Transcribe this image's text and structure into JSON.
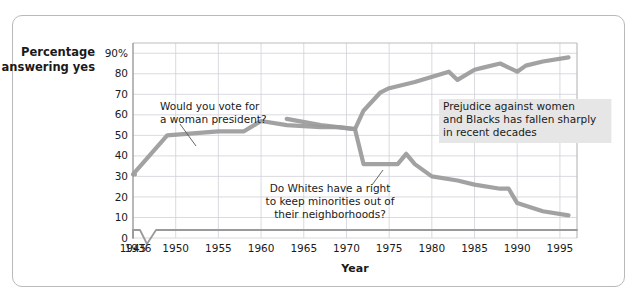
{
  "figure": {
    "border_color": "#b9b9b9",
    "background": "#ffffff"
  },
  "chart_data": {
    "type": "line",
    "title": "",
    "xlabel": "Year",
    "ylabel": "Percentage answering yes",
    "ylabel_line1": "Percentage",
    "ylabel_line2": "answering yes",
    "xlim": [
      1945,
      1997
    ],
    "ylim": [
      0,
      95
    ],
    "grid": true,
    "legend": "none",
    "axis_break": {
      "present": true,
      "between": [
        1936,
        1945
      ],
      "note": "zigzag break on x-axis baseline"
    },
    "series_color": "#9a9a9a",
    "xticks": [
      "1936",
      "1945",
      "1950",
      "1955",
      "1960",
      "1965",
      "1970",
      "1975",
      "1980",
      "1985",
      "1990",
      "1995"
    ],
    "yticks": [
      "0",
      "10",
      "20",
      "30",
      "40",
      "50",
      "60",
      "70",
      "80",
      "90%"
    ],
    "ytick_values": [
      0,
      10,
      20,
      30,
      40,
      50,
      60,
      70,
      80,
      90
    ],
    "series": [
      {
        "name": "Would you vote for a woman president?",
        "color": "#9a9a9a",
        "x": [
          1936,
          1945,
          1949,
          1955,
          1958,
          1960,
          1963,
          1967,
          1969,
          1971,
          1972,
          1974,
          1975,
          1978,
          1982,
          1983,
          1985,
          1986,
          1988,
          1990,
          1991,
          1993,
          1996
        ],
        "y": [
          31,
          31,
          50,
          52,
          52,
          57,
          55,
          54,
          54,
          53,
          62,
          71,
          73,
          76,
          81,
          77,
          82,
          83,
          85,
          81,
          84,
          86,
          88
        ]
      },
      {
        "name": "Do Whites have a right to keep minorities out of their neighborhoods?",
        "color": "#9a9a9a",
        "x": [
          1963,
          1967,
          1969,
          1971,
          1972,
          1976,
          1977,
          1978,
          1980,
          1983,
          1985,
          1988,
          1989,
          1990,
          1993,
          1996
        ],
        "y": [
          58,
          55,
          54,
          53,
          36,
          36,
          41,
          36,
          30,
          28,
          26,
          24,
          24,
          17,
          13,
          11
        ]
      }
    ],
    "annotations": [
      {
        "id": "annot-woman-president",
        "lines": [
          "Would you vote for",
          "a woman president?"
        ],
        "text_x": 160,
        "text_y": 110,
        "leader": {
          "x1": 180,
          "y1": 124,
          "x2": 196,
          "y2": 146
        },
        "highlight": false
      },
      {
        "id": "annot-whites-right",
        "lines": [
          "Do Whites have a right",
          "to keep minorities out of",
          "their neighborhoods?"
        ],
        "text_x": 330,
        "text_y": 192,
        "leader": {
          "x1": 372,
          "y1": 185,
          "x2": 383,
          "y2": 170
        },
        "highlight": false
      },
      {
        "id": "annot-prejudice",
        "lines": [
          "Prejudice against women",
          "and Blacks has fallen sharply",
          "in recent decades"
        ],
        "text_x": 443,
        "text_y": 110,
        "highlight": true,
        "highlight_color": "#e6e6e6"
      }
    ]
  }
}
